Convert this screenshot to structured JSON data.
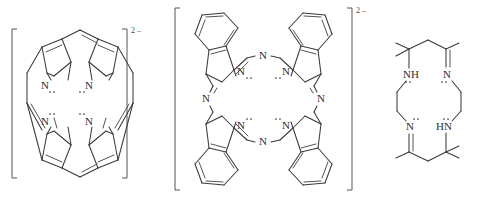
{
  "figure": {
    "kind": "chemical-structure-set",
    "background_color": "#ffffff",
    "line_color": "#3a3a3a",
    "text_color": "#2e2e2e",
    "structure_count": 3
  },
  "structures": [
    {
      "id": "porphyrin-dianion",
      "name": "porphyrin dianion",
      "charge_label": "2 –",
      "bracketed": true,
      "atom_labels": [
        "N",
        "N",
        "N",
        "N"
      ],
      "nitrogen_count": 4,
      "lone_pairs_shown": true
    },
    {
      "id": "phthalocyanine-dianion",
      "name": "phthalocyanine dianion",
      "charge_label": "2 –",
      "bracketed": true,
      "inner_atom_labels": [
        "N",
        "N",
        "N",
        "N"
      ],
      "bridge_atom_labels": [
        "N",
        "N",
        "N",
        "N"
      ],
      "benzo_ring_count": 4,
      "lone_pairs_shown": true
    },
    {
      "id": "tetraaza-macrocycle",
      "name": "tetraaza macrocycle",
      "charge_label": "",
      "bracketed": false,
      "atom_labels": [
        "NH",
        "N",
        "N",
        "HN"
      ],
      "nitrogen_count": 4,
      "methyl_groups": 6,
      "lone_pairs_shown": true
    }
  ],
  "labels": {
    "N": "N",
    "NH": "NH",
    "HN": "HN",
    "charge_2minus": "2 –"
  }
}
